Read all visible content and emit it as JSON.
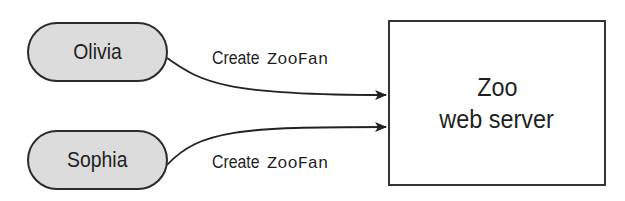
{
  "diagram": {
    "clients": [
      {
        "id": "olivia",
        "label": "Olivia"
      },
      {
        "id": "sophia",
        "label": "Sophia"
      }
    ],
    "server": {
      "line1": "Zoo",
      "line2": "web server"
    },
    "edges": [
      {
        "from": "olivia",
        "to": "server",
        "action": "Create",
        "class_name": "ZooFan"
      },
      {
        "from": "sophia",
        "to": "server",
        "action": "Create",
        "class_name": "ZooFan"
      }
    ]
  },
  "colors": {
    "pill_fill": "#dcdcdc",
    "stroke": "#2b2b2b",
    "background": "#ffffff"
  }
}
